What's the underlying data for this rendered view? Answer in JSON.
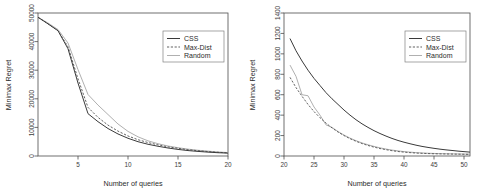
{
  "figure": {
    "background": "#ffffff",
    "panel_count": 2
  },
  "colors": {
    "css": "#3a3a3a",
    "max_dist": "#5a5a5a",
    "random": "#b0b0b0",
    "axis": "#4d4d4d",
    "text": "#2b2b2b"
  },
  "chart_data": [
    {
      "type": "line",
      "panel": "left",
      "title": "",
      "xlabel": "Number of queries",
      "ylabel": "Minimax Regret",
      "xlim": [
        1,
        20
      ],
      "ylim": [
        0,
        50000
      ],
      "xticks": [
        5,
        10,
        15,
        20
      ],
      "xticklabels": [
        "5",
        "10",
        "15",
        "20"
      ],
      "yticks": [
        0,
        10000,
        20000,
        30000,
        40000,
        50000
      ],
      "yticklabels": [
        "0",
        "10000",
        "20000",
        "30000",
        "40000",
        "50000"
      ],
      "grid": false,
      "legend_position": "top-right",
      "legend": [
        "CSS",
        "Max-Dist",
        "Random"
      ],
      "x": [
        1,
        2,
        3,
        4,
        5,
        6,
        7,
        8,
        9,
        10,
        11,
        12,
        13,
        14,
        15,
        16,
        17,
        18,
        19,
        20
      ],
      "series": [
        {
          "name": "CSS",
          "style": "solid",
          "values": [
            48500,
            46200,
            43800,
            37500,
            25500,
            14800,
            12000,
            9600,
            7700,
            6200,
            5000,
            4100,
            3400,
            2800,
            2300,
            1900,
            1600,
            1350,
            1150,
            1000
          ]
        },
        {
          "name": "Max-Dist",
          "style": "dashed",
          "values": [
            48500,
            46200,
            43800,
            38200,
            27000,
            17000,
            13500,
            10800,
            8700,
            7000,
            5700,
            4700,
            3900,
            3200,
            2700,
            2200,
            1850,
            1550,
            1300,
            1100
          ]
        },
        {
          "name": "Random",
          "style": "solid-light",
          "values": [
            48500,
            46500,
            44200,
            39500,
            30200,
            21500,
            17800,
            14500,
            11200,
            8600,
            6700,
            5300,
            4300,
            3500,
            2900,
            2400,
            2000,
            1700,
            1400,
            1200
          ]
        }
      ]
    },
    {
      "type": "line",
      "panel": "right",
      "title": "",
      "xlabel": "Number of queries",
      "ylabel": "Minimax Regret",
      "xlim": [
        20,
        51
      ],
      "ylim": [
        0,
        1400
      ],
      "xticks": [
        20,
        25,
        30,
        35,
        40,
        45,
        50
      ],
      "xticklabels": [
        "20",
        "25",
        "30",
        "35",
        "40",
        "45",
        "50"
      ],
      "yticks": [
        0,
        200,
        400,
        600,
        800,
        1000,
        1200,
        1400
      ],
      "yticklabels": [
        "0",
        "200",
        "400",
        "600",
        "800",
        "1000",
        "1200",
        "1400"
      ],
      "grid": false,
      "legend_position": "top-right",
      "legend": [
        "CSS",
        "Max-Dist",
        "Random"
      ],
      "x": [
        21,
        22,
        23,
        24,
        25,
        26,
        27,
        28,
        29,
        30,
        31,
        32,
        33,
        34,
        35,
        36,
        37,
        38,
        39,
        40,
        41,
        42,
        43,
        44,
        45,
        46,
        47,
        48,
        49,
        50,
        51
      ],
      "series": [
        {
          "name": "CSS",
          "style": "solid",
          "values": [
            1150,
            1030,
            930,
            840,
            760,
            690,
            620,
            560,
            505,
            450,
            400,
            355,
            315,
            280,
            248,
            220,
            195,
            172,
            152,
            135,
            120,
            106,
            94,
            84,
            75,
            67,
            60,
            54,
            48,
            43,
            38
          ]
        },
        {
          "name": "Max-Dist",
          "style": "dashed",
          "values": [
            770,
            670,
            585,
            505,
            435,
            375,
            322,
            275,
            235,
            200,
            170,
            144,
            122,
            103,
            87,
            73,
            62,
            52,
            44,
            38,
            33,
            29,
            26,
            24,
            22,
            21,
            20,
            19,
            18,
            17,
            16
          ]
        },
        {
          "name": "Random",
          "style": "solid-light",
          "values": [
            890,
            780,
            600,
            590,
            480,
            400,
            305,
            280,
            240,
            205,
            175,
            150,
            128,
            110,
            94,
            80,
            68,
            58,
            50,
            43,
            38,
            33,
            30,
            27,
            25,
            23,
            22,
            21,
            20,
            19,
            18
          ]
        }
      ]
    }
  ],
  "left_panel": {
    "name": "left-plot",
    "xlabel": "Number of queries",
    "ylabel": "Minimax Regret",
    "legend": {
      "items": [
        {
          "label": "CSS",
          "style": "solid"
        },
        {
          "label": "Max-Dist",
          "style": "dashed"
        },
        {
          "label": "Random",
          "style": "solid-light"
        }
      ]
    },
    "xticklabels": [
      "5",
      "10",
      "15",
      "20"
    ],
    "yticklabels": [
      "0",
      "10000",
      "20000",
      "30000",
      "40000",
      "50000"
    ]
  },
  "right_panel": {
    "name": "right-plot",
    "xlabel": "Number of queries",
    "ylabel": "Minimax Regret",
    "legend": {
      "items": [
        {
          "label": "CSS",
          "style": "solid"
        },
        {
          "label": "Max-Dist",
          "style": "dashed"
        },
        {
          "label": "Random",
          "style": "solid-light"
        }
      ]
    },
    "xticklabels": [
      "20",
      "25",
      "30",
      "35",
      "40",
      "45",
      "50"
    ],
    "yticklabels": [
      "0",
      "200",
      "400",
      "600",
      "800",
      "1000",
      "1200",
      "1400"
    ]
  }
}
